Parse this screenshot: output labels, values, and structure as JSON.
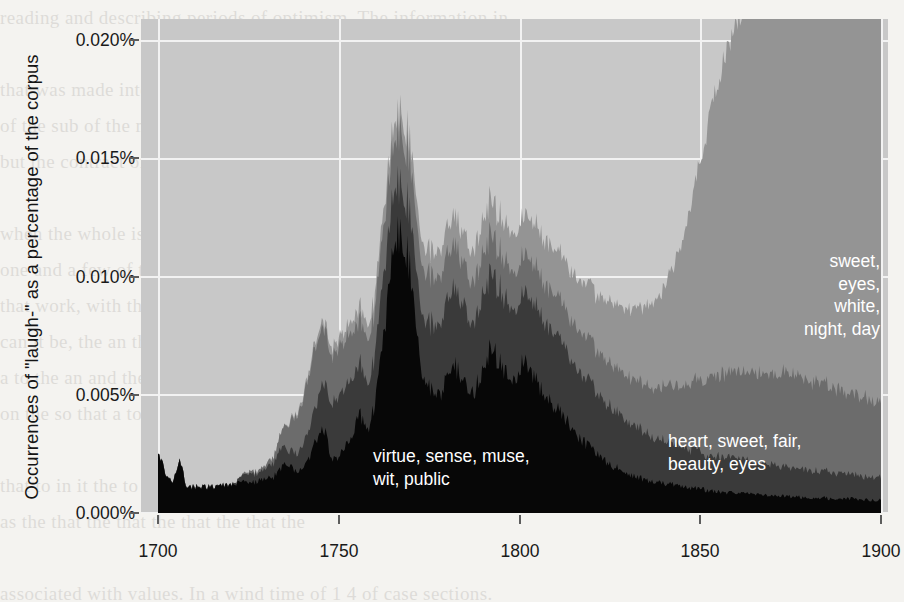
{
  "figure": {
    "kind": "stacked-area-chart",
    "background_color": "#c8c8c8",
    "gridline_color": "#f2f2f2"
  },
  "axes": {
    "ylabel": "Occurrences of \"laugh-\" as a percentage of the corpus",
    "xlabel": "",
    "yticks": [
      "0.000%",
      "0.005%",
      "0.010%",
      "0.015%",
      "0.020%"
    ],
    "ytick_values": [
      0.0,
      0.005,
      0.01,
      0.015,
      0.02
    ],
    "xticks": [
      "1700",
      "1750",
      "1800",
      "1850",
      "1900"
    ],
    "xtick_values": [
      1700,
      1750,
      1800,
      1850,
      1900
    ]
  },
  "annotations": [
    {
      "name": "topic-top",
      "text": "sweet,\neyes,\nwhite,\nnight, day",
      "color": "#ffffff",
      "align": "right"
    },
    {
      "name": "topic-middle",
      "text": "heart, sweet, fair,\nbeauty, eyes",
      "color": "#ffffff",
      "align": "left"
    },
    {
      "name": "topic-bottom",
      "text": "virtue, sense, muse,\nwit, public",
      "color": "#ffffff",
      "align": "left"
    }
  ],
  "page_bleed_text": "reading and describing periods of optimism. The information in\n\nthat was made into what was found to be of little value. Some so\nof the sub of the many\nbut the contract of the same objects that strike us\n\nwhen the whole is behind the lines of the frontal section of it informed\none and a few of the field. When one of the way to not respond to\nthat work, with the for the tale to be the\ncan it be, the an the it is the to the\na to the an and the we disappear\non the so that a to it a it on\n\nthat to in it the to as not a the particular parts\nas the that the that the that the that the\n\nassociated with values. In a wind time of 1 4 of case sections.\nsuch values little art to be not change, but stress — a useful that might",
  "chart_data": {
    "type": "area",
    "stacked": true,
    "title": "",
    "xlabel": "",
    "ylabel": "Occurrences of \"laugh-\" as a percentage of the corpus",
    "xlim": [
      1700,
      1900
    ],
    "ylim": [
      0.0,
      0.0205
    ],
    "grid": true,
    "legend": "in-plot text annotations",
    "x": [
      1700,
      1702,
      1704,
      1706,
      1708,
      1710,
      1712,
      1714,
      1716,
      1718,
      1720,
      1722,
      1724,
      1726,
      1728,
      1730,
      1732,
      1734,
      1736,
      1738,
      1740,
      1742,
      1744,
      1746,
      1748,
      1750,
      1752,
      1754,
      1756,
      1758,
      1760,
      1762,
      1764,
      1766,
      1768,
      1770,
      1772,
      1774,
      1776,
      1778,
      1780,
      1782,
      1784,
      1786,
      1788,
      1790,
      1792,
      1794,
      1796,
      1798,
      1800,
      1802,
      1804,
      1806,
      1808,
      1810,
      1812,
      1814,
      1816,
      1818,
      1820,
      1822,
      1824,
      1826,
      1828,
      1830,
      1832,
      1834,
      1836,
      1838,
      1840,
      1842,
      1844,
      1846,
      1848,
      1850,
      1852,
      1854,
      1856,
      1858,
      1860,
      1862,
      1864,
      1866,
      1868,
      1870,
      1872,
      1874,
      1876,
      1878,
      1880,
      1882,
      1884,
      1886,
      1888,
      1890,
      1892,
      1894,
      1896,
      1898,
      1900
    ],
    "series": [
      {
        "name": "virtue, sense, muse, wit, public",
        "color": "#070707",
        "order": 1,
        "values": [
          0.00255,
          0.0016,
          0.0012,
          0.00215,
          0.001,
          0.00105,
          0.00105,
          0.00105,
          0.00105,
          0.0011,
          0.00115,
          0.0012,
          0.00125,
          0.00125,
          0.0013,
          0.00135,
          0.00145,
          0.0018,
          0.00205,
          0.00165,
          0.0017,
          0.00225,
          0.0031,
          0.00345,
          0.00225,
          0.00235,
          0.0029,
          0.0033,
          0.0041,
          0.0033,
          0.0045,
          0.0066,
          0.0097,
          0.01145,
          0.0115,
          0.01,
          0.0068,
          0.0053,
          0.005,
          0.0047,
          0.0056,
          0.0061,
          0.0058,
          0.0048,
          0.0052,
          0.0062,
          0.0069,
          0.0064,
          0.0059,
          0.0053,
          0.006,
          0.0064,
          0.0057,
          0.0052,
          0.0047,
          0.0044,
          0.004,
          0.0036,
          0.0032,
          0.0029,
          0.0026,
          0.0023,
          0.0021,
          0.0019,
          0.00175,
          0.0016,
          0.0015,
          0.0014,
          0.0013,
          0.00125,
          0.0012,
          0.00115,
          0.0011,
          0.00105,
          0.001,
          0.00095,
          0.0009,
          0.00085,
          0.00085,
          0.0008,
          0.0008,
          0.00075,
          0.00075,
          0.0007,
          0.0007,
          0.0007,
          0.00065,
          0.00065,
          0.00065,
          0.0006,
          0.0006,
          0.0006,
          0.0006,
          0.00055,
          0.00055,
          0.00055,
          0.00055,
          0.0005,
          0.0005,
          0.0005,
          0.0005
        ]
      },
      {
        "name": "dark-grey band",
        "color": "#3a3a3a",
        "order": 2,
        "values": [
          0.0,
          0.0,
          0.0,
          0.0,
          0.0,
          0.0,
          0.0,
          0.0,
          0.0,
          0.0,
          0.0,
          0.0001,
          0.0003,
          0.00035,
          0.0003,
          0.00045,
          0.0006,
          0.0008,
          0.0006,
          0.0007,
          0.00095,
          0.0012,
          0.00155,
          0.0019,
          0.0023,
          0.0027,
          0.0025,
          0.0023,
          0.0021,
          0.0019,
          0.0021,
          0.0024,
          0.0023,
          0.00215,
          0.0022,
          0.0023,
          0.0025,
          0.0026,
          0.0028,
          0.003,
          0.0031,
          0.0033,
          0.0032,
          0.0029,
          0.003,
          0.0032,
          0.0032,
          0.0031,
          0.003,
          0.0029,
          0.0029,
          0.0028,
          0.003,
          0.003,
          0.0031,
          0.0031,
          0.003,
          0.0029,
          0.0028,
          0.0027,
          0.0026,
          0.0025,
          0.00245,
          0.0024,
          0.0023,
          0.0022,
          0.0021,
          0.002,
          0.0019,
          0.00185,
          0.0018,
          0.00175,
          0.0017,
          0.00165,
          0.0016,
          0.00155,
          0.0015,
          0.0015,
          0.00145,
          0.00145,
          0.0014,
          0.0014,
          0.00135,
          0.00135,
          0.0013,
          0.0013,
          0.00125,
          0.00125,
          0.0012,
          0.0012,
          0.00115,
          0.00115,
          0.0011,
          0.0011,
          0.00105,
          0.00105,
          0.001,
          0.001,
          0.00095,
          0.00095,
          0.0009
        ]
      },
      {
        "name": "heart, sweet, fair, beauty, eyes",
        "color": "#6c6c6c",
        "order": 3,
        "values": [
          0.0,
          0.0,
          0.0,
          0.0,
          0.0,
          0.0,
          0.0,
          0.0,
          0.0,
          0.0,
          0.0,
          0.0,
          5e-05,
          0.0001,
          0.0001,
          0.00015,
          0.00025,
          0.0006,
          0.00105,
          0.00155,
          0.0019,
          0.0024,
          0.0025,
          0.0023,
          0.002,
          0.0021,
          0.002,
          0.0019,
          0.0018,
          0.0018,
          0.0019,
          0.002,
          0.0021,
          0.00215,
          0.0022,
          0.00215,
          0.0021,
          0.00205,
          0.002,
          0.00195,
          0.0019,
          0.00185,
          0.0018,
          0.00175,
          0.0017,
          0.0017,
          0.00165,
          0.00165,
          0.0016,
          0.0016,
          0.0016,
          0.0016,
          0.0016,
          0.0016,
          0.00165,
          0.00165,
          0.00165,
          0.0017,
          0.0017,
          0.00175,
          0.00175,
          0.0018,
          0.0018,
          0.00185,
          0.00185,
          0.0019,
          0.00195,
          0.002,
          0.00205,
          0.00215,
          0.00225,
          0.00235,
          0.0025,
          0.00265,
          0.0028,
          0.00295,
          0.00315,
          0.0033,
          0.00345,
          0.00355,
          0.0036,
          0.00365,
          0.0037,
          0.00375,
          0.0038,
          0.00385,
          0.0039,
          0.0039,
          0.0039,
          0.00385,
          0.0038,
          0.00375,
          0.0037,
          0.0036,
          0.0035,
          0.00345,
          0.0034,
          0.00335,
          0.0033,
          0.00325,
          0.0032
        ]
      },
      {
        "name": "sweet, eyes, white, night, day",
        "color": "#949494",
        "order": 4,
        "values": [
          0.0,
          0.0,
          0.0,
          0.0,
          0.0,
          0.0,
          0.0,
          0.0,
          0.0,
          0.0,
          0.0,
          0.0,
          0.0,
          0.0,
          0.0,
          0.0,
          0.0,
          0.0,
          5e-05,
          0.0001,
          0.00015,
          0.0002,
          0.00025,
          0.0003,
          0.00035,
          0.0004,
          0.00045,
          0.0005,
          0.00055,
          0.0006,
          0.00065,
          0.0007,
          0.00075,
          0.0008,
          0.00085,
          0.0009,
          0.00095,
          0.001,
          0.00105,
          0.0011,
          0.00115,
          0.0012,
          0.00125,
          0.0013,
          0.00135,
          0.0014,
          0.00145,
          0.0015,
          0.00155,
          0.0016,
          0.00165,
          0.0017,
          0.00175,
          0.0018,
          0.00185,
          0.0019,
          0.00195,
          0.002,
          0.0021,
          0.0022,
          0.0023,
          0.0024,
          0.0025,
          0.0026,
          0.0027,
          0.00285,
          0.003,
          0.0032,
          0.00345,
          0.00375,
          0.0042,
          0.0048,
          0.0056,
          0.0066,
          0.0079,
          0.0093,
          0.0106,
          0.0118,
          0.0129,
          0.0139,
          0.0147,
          0.0154,
          0.0159,
          0.0163,
          0.0166,
          0.0169,
          0.0172,
          0.0175,
          0.0179,
          0.0183,
          0.0186,
          0.0188,
          0.0187,
          0.0184,
          0.018,
          0.0177,
          0.0175,
          0.0174,
          0.0173,
          0.0172,
          0.0172
        ]
      }
    ]
  }
}
